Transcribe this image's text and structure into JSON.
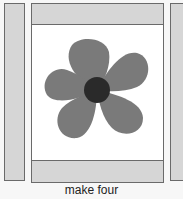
{
  "caption": "make four",
  "colors": {
    "strip": "#d6d6d6",
    "petal": "#7a7a7a",
    "center": "#2a2a2a",
    "border": "#6a6a6a"
  },
  "diagram": {
    "type": "quilt-block",
    "elements": [
      "left-strip",
      "center-block",
      "top-strip",
      "bottom-strip",
      "flower-applique",
      "right-strip"
    ],
    "flower": {
      "petals": 5
    }
  }
}
